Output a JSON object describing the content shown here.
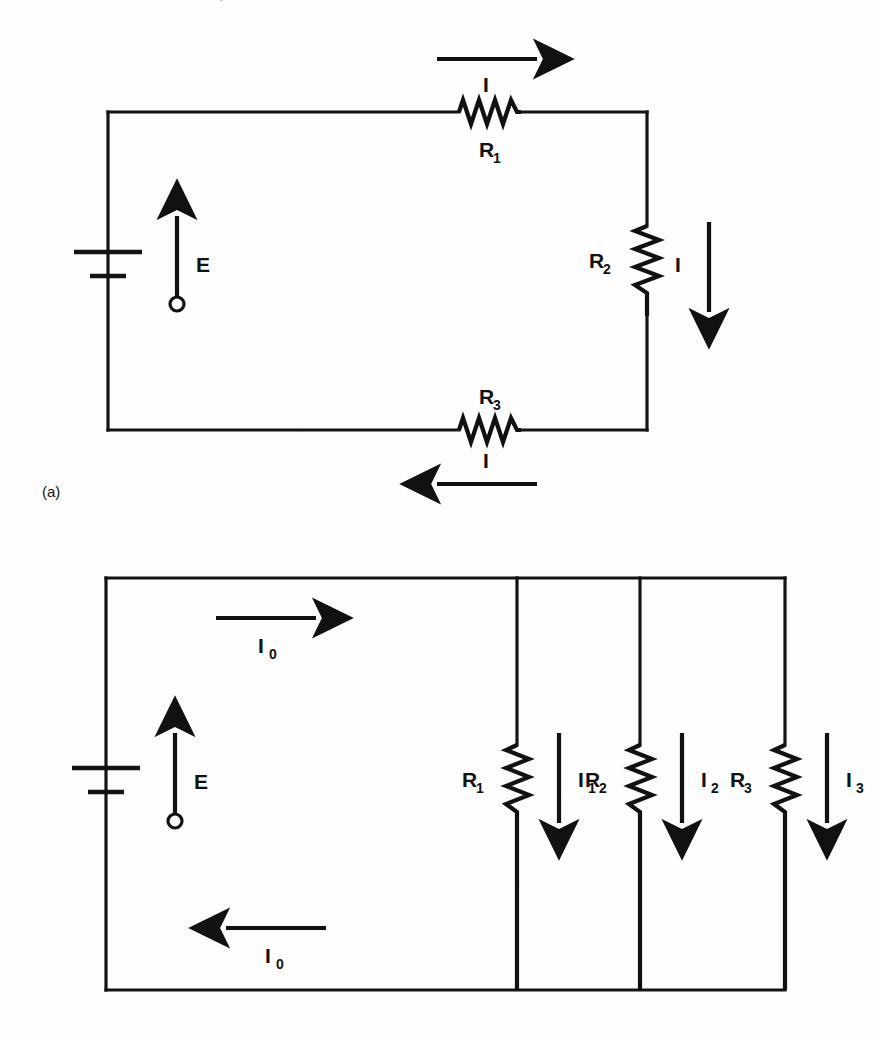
{
  "page": {
    "width": 874,
    "height": 1039,
    "background_color": "#fdfdfd",
    "ink_color": "#111111",
    "clipped_header_text": "Resistors in series and in parallel"
  },
  "figures": [
    {
      "id": "figure-a",
      "caption": "(a)",
      "description": "Series circuit: battery with emf E drives current I through three resistors R1, R2, R3 in series.",
      "source": {
        "label": "E",
        "symbol": "battery",
        "terminal_marker": "open-circle"
      },
      "components": [
        {
          "name": "R1",
          "label": "R",
          "subscript": "1",
          "orientation": "horizontal",
          "position": "top-branch"
        },
        {
          "name": "R2",
          "label": "R",
          "subscript": "2",
          "orientation": "vertical",
          "position": "right-branch"
        },
        {
          "name": "R3",
          "label": "R",
          "subscript": "3",
          "orientation": "horizontal",
          "position": "bottom-branch"
        }
      ],
      "currents": [
        {
          "name": "I-top",
          "label": "I",
          "subscript": "",
          "direction": "right",
          "position": "above-R1"
        },
        {
          "name": "I-right",
          "label": "I",
          "subscript": "",
          "direction": "down",
          "position": "right-of-R2"
        },
        {
          "name": "I-bottom",
          "label": "I",
          "subscript": "",
          "direction": "left",
          "position": "below-R3"
        }
      ],
      "emf": {
        "label": "E",
        "direction": "up"
      }
    },
    {
      "id": "figure-b",
      "caption": "",
      "description": "Parallel circuit: battery with emf E drives total current I0 which splits into I1, I2, I3 through parallel resistors R1, R2, R3.",
      "source": {
        "label": "E",
        "symbol": "battery",
        "terminal_marker": "open-circle"
      },
      "components": [
        {
          "name": "R1",
          "label": "R",
          "subscript": "1",
          "orientation": "vertical",
          "position": "branch-1"
        },
        {
          "name": "R2",
          "label": "R",
          "subscript": "2",
          "orientation": "vertical",
          "position": "branch-2"
        },
        {
          "name": "R3",
          "label": "R",
          "subscript": "3",
          "orientation": "vertical",
          "position": "branch-3"
        }
      ],
      "currents": [
        {
          "name": "I0-top",
          "label": "I",
          "subscript": "0",
          "direction": "right",
          "position": "top-wire"
        },
        {
          "name": "I0-bottom",
          "label": "I",
          "subscript": "0",
          "direction": "left",
          "position": "bottom-wire"
        },
        {
          "name": "I1",
          "label": "I",
          "subscript": "1",
          "direction": "down",
          "position": "right-of-R1"
        },
        {
          "name": "I2",
          "label": "I",
          "subscript": "2",
          "direction": "down",
          "position": "right-of-R2"
        },
        {
          "name": "I3",
          "label": "I",
          "subscript": "3",
          "direction": "down",
          "position": "right-of-R3"
        }
      ],
      "emf": {
        "label": "E",
        "direction": "up"
      }
    }
  ]
}
